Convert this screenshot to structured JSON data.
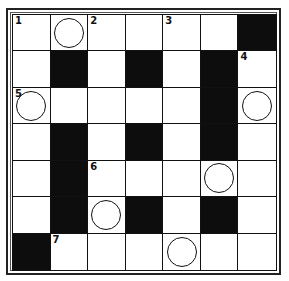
{
  "puzzle": {
    "type": "crossword",
    "rows": 7,
    "cols": 7,
    "colors": {
      "black": "#0d0d0d",
      "white": "#ffffff",
      "line": "#111111"
    },
    "grid": [
      [
        {
          "t": "W",
          "num": "1"
        },
        {
          "t": "W",
          "circle": true
        },
        {
          "t": "W",
          "num": "2"
        },
        {
          "t": "W"
        },
        {
          "t": "W",
          "num": "3"
        },
        {
          "t": "W"
        },
        {
          "t": "B"
        }
      ],
      [
        {
          "t": "W"
        },
        {
          "t": "B"
        },
        {
          "t": "W"
        },
        {
          "t": "B"
        },
        {
          "t": "W"
        },
        {
          "t": "B"
        },
        {
          "t": "W",
          "num": "4"
        }
      ],
      [
        {
          "t": "W",
          "num": "5",
          "circle": true
        },
        {
          "t": "W"
        },
        {
          "t": "W"
        },
        {
          "t": "W"
        },
        {
          "t": "W"
        },
        {
          "t": "B"
        },
        {
          "t": "W",
          "circle": true
        }
      ],
      [
        {
          "t": "W"
        },
        {
          "t": "B"
        },
        {
          "t": "W"
        },
        {
          "t": "B"
        },
        {
          "t": "W"
        },
        {
          "t": "B"
        },
        {
          "t": "W"
        }
      ],
      [
        {
          "t": "W"
        },
        {
          "t": "B"
        },
        {
          "t": "W",
          "num": "6"
        },
        {
          "t": "W"
        },
        {
          "t": "W"
        },
        {
          "t": "W",
          "circle": true
        },
        {
          "t": "W"
        }
      ],
      [
        {
          "t": "W"
        },
        {
          "t": "B"
        },
        {
          "t": "W",
          "circle": true
        },
        {
          "t": "B"
        },
        {
          "t": "W"
        },
        {
          "t": "B"
        },
        {
          "t": "W"
        }
      ],
      [
        {
          "t": "B"
        },
        {
          "t": "W",
          "num": "7"
        },
        {
          "t": "W"
        },
        {
          "t": "W"
        },
        {
          "t": "W",
          "circle": true
        },
        {
          "t": "W"
        },
        {
          "t": "W"
        }
      ]
    ]
  }
}
